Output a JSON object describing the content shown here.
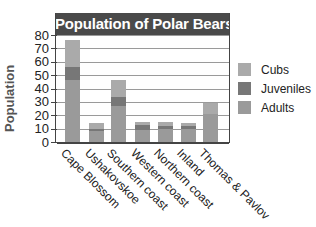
{
  "chart_data": {
    "type": "bar",
    "stacked": true,
    "title": "Population of Polar Bears",
    "xlabel": "",
    "ylabel": "Population",
    "ylim": [
      0,
      80
    ],
    "yticks": [
      0,
      10,
      20,
      30,
      40,
      50,
      60,
      70,
      80
    ],
    "grid": true,
    "legend_position": "right",
    "categories": [
      "Cape Blossom",
      "Ushakovskoe",
      "Southern coast",
      "Western coast",
      "Northern coast",
      "Inland",
      "Thomas & Pavlov"
    ],
    "series": [
      {
        "name": "Adults",
        "color": "#9a9a9a",
        "values": [
          46,
          8,
          27,
          9,
          10,
          10,
          21
        ]
      },
      {
        "name": "Juveniles",
        "color": "#777777",
        "values": [
          10,
          2,
          7,
          4,
          2,
          2,
          0
        ]
      },
      {
        "name": "Cubs",
        "color": "#aaaaaa",
        "values": [
          20,
          4,
          12,
          2,
          3,
          2,
          8
        ]
      }
    ],
    "totals": [
      76,
      14,
      46,
      15,
      15,
      14,
      29
    ]
  },
  "legend": {
    "items": [
      {
        "label": "Cubs",
        "color": "#aaaaaa"
      },
      {
        "label": "Juveniles",
        "color": "#777777"
      },
      {
        "label": "Adults",
        "color": "#9a9a9a"
      }
    ]
  }
}
